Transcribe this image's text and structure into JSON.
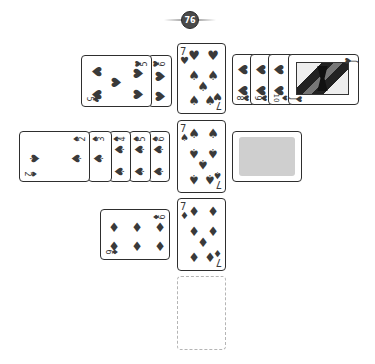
{
  "score_badge": {
    "value": "76"
  },
  "board": {
    "hearts": {
      "left_pile": [
        {
          "rank": "6",
          "suit": "♥",
          "label": "6 of hearts"
        },
        {
          "rank": "5",
          "suit": "♥",
          "label": "5 of hearts"
        }
      ],
      "center": {
        "rank": "7",
        "suit": "♥",
        "label": "7 of hearts"
      },
      "right_pile": [
        {
          "rank": "8",
          "suit": "♥",
          "label": "8 of hearts"
        },
        {
          "rank": "9",
          "suit": "♥",
          "label": "9 of hearts"
        },
        {
          "rank": "10",
          "suit": "♥",
          "label": "10 of hearts"
        },
        {
          "rank": "J",
          "suit": "♥",
          "label": "Jack of hearts"
        }
      ]
    },
    "spades": {
      "left_pile": [
        {
          "rank": "6",
          "suit": "♠"
        },
        {
          "rank": "5",
          "suit": "♠"
        },
        {
          "rank": "4",
          "suit": "♠"
        },
        {
          "rank": "3",
          "suit": "♠"
        },
        {
          "rank": "2",
          "suit": "♠"
        }
      ],
      "center": {
        "rank": "7",
        "suit": "♠",
        "label": "7 of spades"
      },
      "right": {
        "face_down": true,
        "label": "face-down card"
      }
    },
    "diamonds": {
      "left_pile": [
        {
          "rank": "6",
          "suit": "♦",
          "label": "6 of diamonds"
        }
      ],
      "center": {
        "rank": "7",
        "suit": "♦",
        "label": "7 of diamonds"
      }
    },
    "clubs": {
      "center": {
        "empty": true,
        "label": "empty clubs slot"
      }
    }
  },
  "colors": {
    "ink": "#3a3a3a",
    "border": "#2e2e2e",
    "card_back": "#cfcfcf",
    "badge": "#4a4a4a"
  }
}
